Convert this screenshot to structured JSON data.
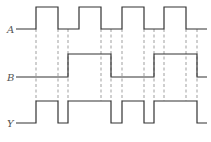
{
  "diagram": {
    "type": "timing-diagram",
    "signals": [
      {
        "name": "A",
        "label_x": 7,
        "label_y": 33,
        "start_x": 16,
        "end_x": 207,
        "low_y": 29,
        "high_y": 7,
        "edges": [
          36,
          58,
          79,
          101,
          122,
          144,
          164,
          186
        ],
        "initial": 0
      },
      {
        "name": "B",
        "label_x": 7,
        "label_y": 81,
        "start_x": 16,
        "end_x": 207,
        "low_y": 77,
        "high_y": 54,
        "edges": [
          68,
          111,
          154,
          197
        ],
        "initial": 0
      },
      {
        "name": "Y",
        "label_x": 7,
        "label_y": 127,
        "start_x": 16,
        "end_x": 207,
        "low_y": 123,
        "high_y": 101,
        "edges": [
          36,
          58,
          68,
          111,
          122,
          144,
          154,
          197
        ],
        "initial": 0
      }
    ],
    "guide_lines": {
      "x": [
        36,
        58,
        68,
        101,
        111,
        122,
        144,
        154,
        164,
        186,
        197
      ],
      "y_top": 29,
      "y_bottom": 101
    },
    "colors": {
      "signal": "#333333",
      "guide": "#777777",
      "label": "#555555"
    }
  }
}
